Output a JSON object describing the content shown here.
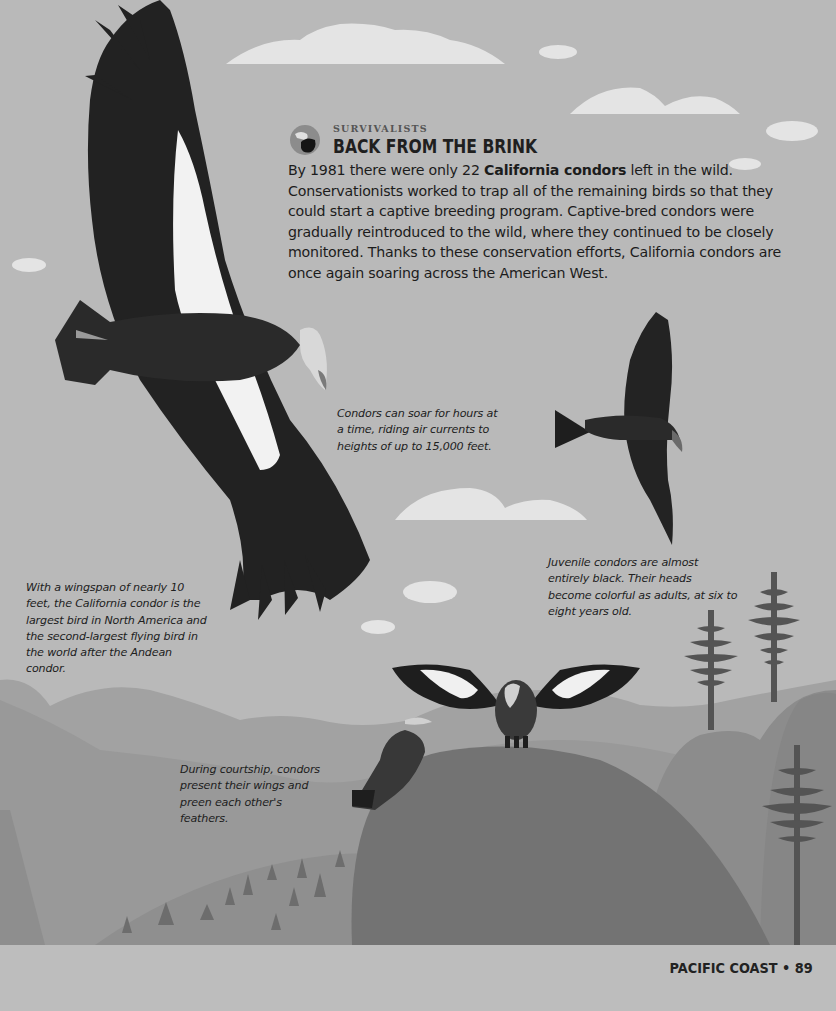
{
  "header": {
    "kicker": "SURVIVALISTS",
    "title": "BACK FROM THE BRINK",
    "badge_icon": "condor-head-badge-icon"
  },
  "intro": {
    "part1": "By 1981 there were only 22 ",
    "bold": "California condors",
    "part2": " left in the wild. Conservationists worked to trap all of the remaining birds so that they could start a captive breeding program. Captive-bred condors were gradually reintroduced to the wild, where they continued to be closely monitored. Thanks to these conservation efforts, California condors are once again soaring across the American West."
  },
  "captions": {
    "soaring": "Condors can soar for hours at a time, riding air currents to heights of up to 15,000 feet.",
    "juvenile": "Juvenile condors are almost entirely black. Their heads become colorful as adults, at six to eight years old.",
    "wingspan": "With a wingspan of nearly 10 feet, the California condor is the largest bird in North America and the second-largest flying bird in the world after the Andean condor.",
    "courtship": "During courtship, condors present their wings and preen each other's feathers."
  },
  "footer": {
    "section": "PACIFIC COAST",
    "separator": "•",
    "page_number": "89"
  },
  "illustration": {
    "elements": [
      "large-soaring-condor",
      "juvenile-condor",
      "courtship-condor-spread-wings",
      "perched-condor",
      "redwood-trees",
      "rolling-hills",
      "clouds"
    ]
  },
  "colors": {
    "sky": "#b8b8b8",
    "cloud": "#e6e6e6",
    "bird_dark": "#1e1e1e",
    "bird_white": "#f2f2f2",
    "hill_far": "#9a9a9a",
    "hill_mid": "#8a8a8a",
    "hill_near": "#6f6f6f",
    "tree": "#505050",
    "text": "#1c1c1c"
  }
}
